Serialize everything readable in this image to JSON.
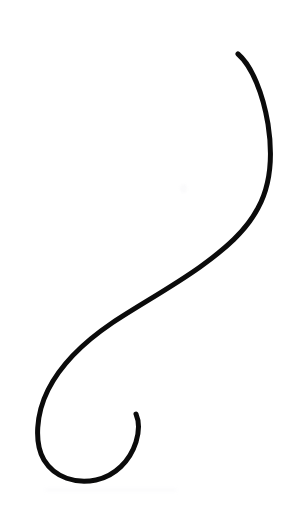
{
  "canvas": {
    "width": 295,
    "height": 526,
    "background_color": "#ffffff",
    "title": "Curve Stroke"
  },
  "artwork": {
    "name": "s-curve-flourish",
    "description": "Single continuous hand-drawn S-shaped calligraphic flourish with a large open loop at the lower left and a tapered tail",
    "stroke_color": "#0b0b0b",
    "stroke_width": 5,
    "line_cap": "round",
    "line_join": "round",
    "fill": "none",
    "path": "M 238 54 C 252 66 263 94 268 124 C 273 156 270 186 258 208 C 246 231 225 249 200 267 C 172 287 139 305 112 323 C 84 342 61 364 48 390 C 36 414 34 443 44 460 C 55 478 76 484 96 480 C 115 476 130 461 136 442 C 140 429 139 421 136 414"
  },
  "chart_data": {
    "type": "line",
    "title": "",
    "xlabel": "",
    "ylabel": "",
    "xlim": [
      0,
      295
    ],
    "ylim": [
      0,
      526
    ],
    "grid": false,
    "legend": null,
    "series": [
      {
        "name": "s-curve-flourish",
        "color": "#0b0b0b",
        "points": [
          [
            238,
            54
          ],
          [
            248,
            66
          ],
          [
            258,
            88
          ],
          [
            265,
            112
          ],
          [
            269,
            138
          ],
          [
            269,
            160
          ],
          [
            265,
            182
          ],
          [
            257,
            202
          ],
          [
            245,
            219
          ],
          [
            229,
            236
          ],
          [
            210,
            252
          ],
          [
            190,
            268
          ],
          [
            168,
            283
          ],
          [
            146,
            297
          ],
          [
            124,
            311
          ],
          [
            103,
            327
          ],
          [
            84,
            344
          ],
          [
            68,
            362
          ],
          [
            55,
            382
          ],
          [
            46,
            403
          ],
          [
            41,
            424
          ],
          [
            41,
            444
          ],
          [
            47,
            461
          ],
          [
            59,
            473
          ],
          [
            75,
            480
          ],
          [
            92,
            481
          ],
          [
            108,
            474
          ],
          [
            121,
            463
          ],
          [
            131,
            448
          ],
          [
            136,
            431
          ],
          [
            136,
            414
          ]
        ]
      }
    ],
    "annotations": [
      {
        "label": "top-endpoint",
        "x": 238,
        "y": 54
      },
      {
        "label": "rightmost-extent",
        "x": 269,
        "y": 150
      },
      {
        "label": "inflection-point",
        "x": 150,
        "y": 293
      },
      {
        "label": "leftmost-extent",
        "x": 36,
        "y": 440
      },
      {
        "label": "bottom-extent",
        "x": 85,
        "y": 478
      },
      {
        "label": "tail-endpoint",
        "x": 136,
        "y": 414
      }
    ]
  },
  "artifacts": {
    "bottom_smudge": {
      "visible": true,
      "color": "#fcfcfd"
    },
    "mid_speck": {
      "visible": true,
      "color": "#fbfbfc"
    }
  }
}
